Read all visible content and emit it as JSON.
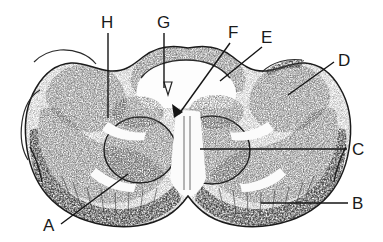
{
  "figure": {
    "kind": "histological-cross-section",
    "background_color": "#ffffff",
    "ink_color": "#151515",
    "label_color": "#1a1a1a",
    "width": 383,
    "height": 242
  },
  "labels": [
    {
      "id": "A",
      "text": "A",
      "text_x": 43,
      "text_y": 231,
      "leader": "M 61 224 L 128 174",
      "anchor_side": "bottom-left"
    },
    {
      "id": "B",
      "text": "B",
      "text_x": 352,
      "text_y": 209,
      "leader": "M 348 203 L 261 203",
      "anchor_side": "right"
    },
    {
      "id": "C",
      "text": "C",
      "text_x": 352,
      "text_y": 155,
      "leader": "M 347 149 L 200 149",
      "anchor_side": "right"
    },
    {
      "id": "D",
      "text": "D",
      "text_x": 338,
      "text_y": 66,
      "leader": "M 334 62 L 288 95",
      "anchor_side": "top-right"
    },
    {
      "id": "E",
      "text": "E",
      "text_x": 261,
      "text_y": 43,
      "leader": "M 262 47 L 220 81",
      "anchor_side": "top"
    },
    {
      "id": "F",
      "text": "F",
      "text_x": 228,
      "text_y": 38,
      "leader": "M 230 43 L 179 114",
      "anchor_side": "top"
    },
    {
      "id": "G",
      "text": "G",
      "text_x": 157,
      "text_y": 28,
      "leader": "M 164 33 L 164 88",
      "anchor_side": "top"
    },
    {
      "id": "H",
      "text": "H",
      "text_x": 101,
      "text_y": 28,
      "leader": "M 108 33 L 108 118",
      "anchor_side": "top"
    }
  ],
  "markers": {
    "arrowhead_at_f": {
      "x": 179,
      "y": 114
    },
    "central_canal_glyph": {
      "x": 168,
      "y": 88
    }
  }
}
